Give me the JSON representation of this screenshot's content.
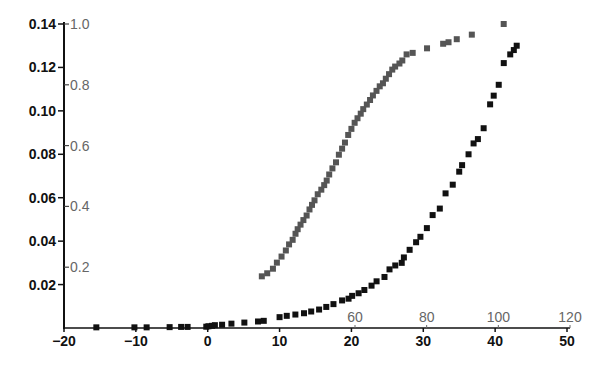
{
  "chart_data": {
    "type": "scatter",
    "title": "",
    "xlabel": "",
    "ylabel": "",
    "grid": false,
    "legend": null,
    "axes": {
      "x_primary": {
        "position": "bottom",
        "range": [
          -20,
          50
        ],
        "ticks": [
          -20,
          -10,
          0,
          10,
          20,
          30,
          40,
          50
        ],
        "tick_labels": [
          "−20",
          "−10",
          "0",
          "10",
          "20",
          "30",
          "40",
          "50"
        ],
        "color": "#111111"
      },
      "x_secondary": {
        "position": "top-inner",
        "ticks": [
          60,
          80,
          100,
          120
        ],
        "tick_labels": [
          "60",
          "80",
          "100",
          "120"
        ],
        "color": "#666666"
      },
      "y_primary": {
        "position": "left",
        "range": [
          0,
          0.14
        ],
        "ticks": [
          0.02,
          0.04,
          0.06,
          0.08,
          0.1,
          0.12,
          0.14
        ],
        "tick_labels": [
          "0.02",
          "0.04",
          "0.06",
          "0.08",
          "0.10",
          "0.12",
          "0.14"
        ],
        "color": "#111111"
      },
      "y_secondary": {
        "position": "left-inner",
        "range": [
          0,
          1.0
        ],
        "ticks": [
          0.2,
          0.4,
          0.6,
          0.8,
          1.0
        ],
        "tick_labels": [
          "0.2",
          "0.4",
          "0.6",
          "0.8",
          "1.0"
        ],
        "color": "#666666"
      }
    },
    "series": [
      {
        "name": "black series (bottom x vs left y)",
        "color": "#111111",
        "marker": "square",
        "x": [
          -15.5,
          -10.2,
          -8.5,
          -5.3,
          -3.7,
          -2.8,
          -0.2,
          0.1,
          0.6,
          1.0,
          2.0,
          3.3,
          5.1,
          7.0,
          7.8,
          10.0,
          11.0,
          12.2,
          13.4,
          14.4,
          15.5,
          16.5,
          17.5,
          18.7,
          19.6,
          20.1,
          21.0,
          21.8,
          22.8,
          23.5,
          24.6,
          25.3,
          26.1,
          27.0,
          27.3,
          28.1,
          29.0,
          29.6,
          30.5,
          31.3,
          32.3,
          33.1,
          34.1,
          35.0,
          35.4,
          36.3,
          37.0,
          37.6,
          38.4,
          39.3,
          39.8,
          40.5,
          41.2,
          42.1,
          42.6,
          43.0
        ],
        "y": [
          0.0003,
          0.0003,
          0.0003,
          0.0004,
          0.0005,
          0.0005,
          0.0006,
          0.0008,
          0.001,
          0.0013,
          0.0015,
          0.002,
          0.0025,
          0.003,
          0.0033,
          0.005,
          0.0056,
          0.0062,
          0.0068,
          0.0076,
          0.0085,
          0.0097,
          0.011,
          0.0127,
          0.0135,
          0.0148,
          0.016,
          0.0175,
          0.0195,
          0.0215,
          0.0235,
          0.027,
          0.0288,
          0.03,
          0.0325,
          0.036,
          0.0395,
          0.042,
          0.046,
          0.052,
          0.055,
          0.062,
          0.066,
          0.072,
          0.075,
          0.08,
          0.085,
          0.087,
          0.092,
          0.103,
          0.107,
          0.112,
          0.122,
          0.126,
          0.128,
          0.13
        ]
      },
      {
        "name": "gray series (top x vs inner y)",
        "color": "#555555",
        "marker": "square",
        "x": [
          34,
          35.5,
          37.1,
          38.2,
          39.5,
          40.7,
          41.6,
          42.6,
          43.4,
          44.0,
          44.8,
          45.6,
          46.5,
          47.3,
          48.0,
          48.7,
          49.6,
          50.6,
          51.4,
          52.1,
          52.8,
          53.7,
          54.7,
          55.5,
          56.4,
          57.2,
          58.1,
          59.0,
          59.9,
          60.7,
          61.6,
          62.3,
          63.3,
          64.2,
          65.0,
          66.0,
          66.9,
          67.8,
          68.6,
          69.5,
          70.4,
          71.2,
          72.4,
          73.2,
          74.4,
          76.1,
          80.1,
          84.6,
          86.1,
          88.4,
          92.6,
          101.5
        ],
        "y": [
          0.17,
          0.18,
          0.195,
          0.215,
          0.235,
          0.255,
          0.275,
          0.29,
          0.31,
          0.325,
          0.34,
          0.355,
          0.37,
          0.39,
          0.405,
          0.42,
          0.44,
          0.455,
          0.47,
          0.485,
          0.505,
          0.525,
          0.545,
          0.57,
          0.59,
          0.61,
          0.635,
          0.655,
          0.675,
          0.69,
          0.705,
          0.72,
          0.735,
          0.75,
          0.765,
          0.78,
          0.795,
          0.805,
          0.82,
          0.835,
          0.85,
          0.86,
          0.87,
          0.88,
          0.9,
          0.905,
          0.92,
          0.935,
          0.94,
          0.95,
          0.965,
          1.0
        ]
      }
    ]
  }
}
